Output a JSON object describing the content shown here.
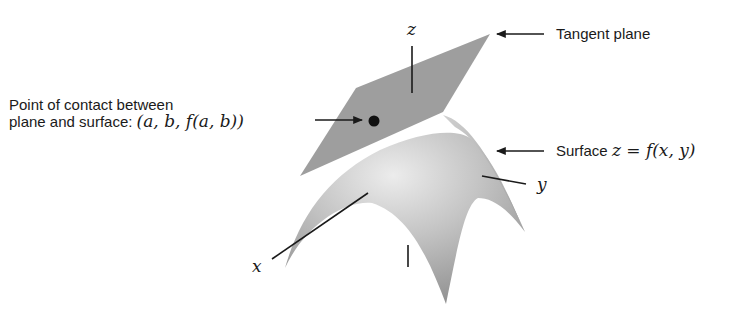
{
  "diagram": {
    "labels": {
      "tangent_plane": "Tangent plane",
      "contact_line1": "Point of contact between",
      "contact_line2_text": "plane and surface: ",
      "contact_line2_math": "(a, b, f(a, b))",
      "surface_text": "Surface ",
      "surface_math": "z = f(x, y)",
      "axis_x": "x",
      "axis_y": "y",
      "axis_z": "z"
    },
    "colors": {
      "plane": "#9e9e9e",
      "surface_light": "#e6e6e6",
      "surface_mid": "#b5b5b5",
      "surface_dark": "#8f8f8f",
      "ink": "#1a1a1a",
      "background": "#ffffff"
    }
  }
}
